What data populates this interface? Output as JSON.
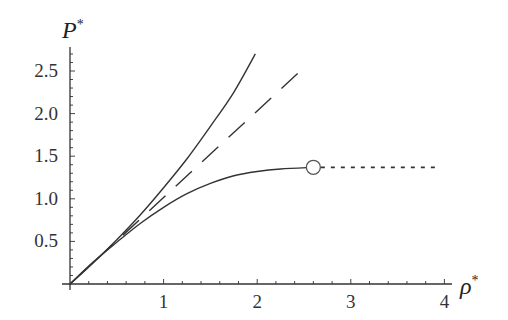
{
  "chart_data": {
    "type": "line",
    "title": "",
    "xlabel": "ρ*",
    "ylabel": "P*",
    "xlim": [
      0,
      4.05
    ],
    "ylim": [
      0,
      2.8
    ],
    "x_ticks": [
      1,
      2,
      3,
      4
    ],
    "x_tick_labels": [
      "1",
      "2",
      "3",
      "4"
    ],
    "y_ticks": [
      0.5,
      1.0,
      1.5,
      2.0,
      2.5
    ],
    "y_tick_labels": [
      "0.5",
      "1.0",
      "1.5",
      "2.0",
      "2.5"
    ],
    "grid": false,
    "legend": null,
    "series": [
      {
        "name": "upper-solid-curve",
        "style": "solid",
        "x": [
          0,
          0.25,
          0.5,
          0.75,
          1.0,
          1.25,
          1.5,
          1.75,
          1.98
        ],
        "y": [
          0,
          0.25,
          0.52,
          0.81,
          1.13,
          1.47,
          1.85,
          2.25,
          2.7
        ]
      },
      {
        "name": "dashed-line",
        "style": "dashed",
        "x": [
          0,
          2.52
        ],
        "y": [
          0,
          2.56
        ]
      },
      {
        "name": "lower-solid-curve",
        "style": "solid",
        "x": [
          0,
          0.25,
          0.5,
          0.75,
          1.0,
          1.25,
          1.5,
          1.75,
          2.0,
          2.25,
          2.6
        ],
        "y": [
          0,
          0.26,
          0.49,
          0.71,
          0.9,
          1.06,
          1.18,
          1.27,
          1.32,
          1.35,
          1.37
        ]
      },
      {
        "name": "dotted-line",
        "style": "dotted",
        "x": [
          2.68,
          3.95
        ],
        "y": [
          1.37,
          1.37
        ]
      }
    ],
    "annotations": [
      {
        "type": "open-circle",
        "x": 2.6,
        "y": 1.37
      }
    ]
  },
  "axes": {
    "x_label_main": "ρ",
    "x_label_sup": "*",
    "y_label_main": "P",
    "y_label_sup": "*"
  }
}
